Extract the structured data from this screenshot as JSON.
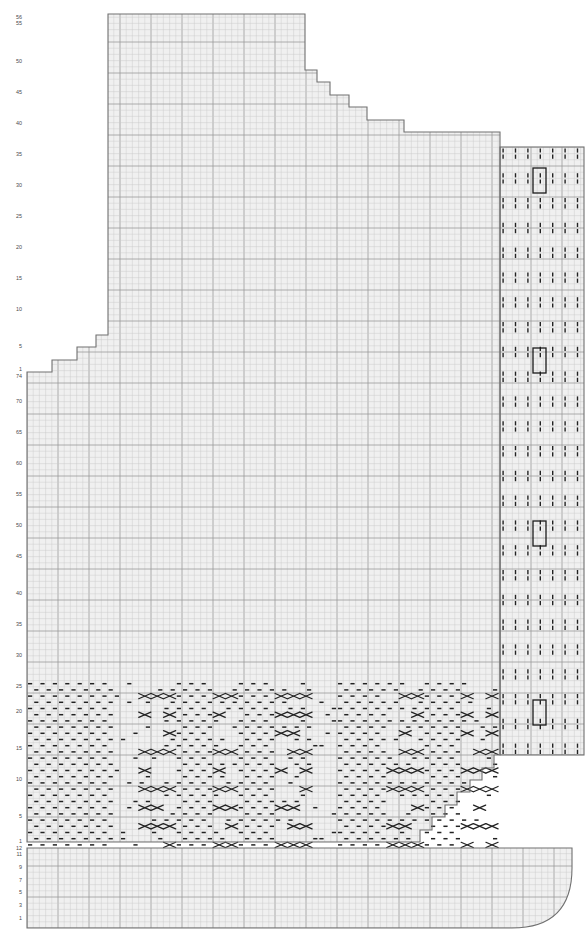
{
  "document": {
    "title": "Knitting Chart — Cabled Sweater Front/Back Panel",
    "background_color": "#ffffff",
    "width": 588,
    "height": 935
  },
  "chart_data": {
    "type": "heatmap",
    "xlabel": "",
    "ylabel": "Row",
    "grid": true,
    "legend_position": "none",
    "cell_size": 6.2,
    "colors": {
      "grid_minor": "#c9c9c9",
      "grid_major": "#9a9a9a",
      "outline": "#707070",
      "symbol": "#222222",
      "cell_fill": "#f0f0f0",
      "repeat_box": "#1a1a1a"
    },
    "panels": [
      {
        "name": "main-body",
        "description": "Large stepped body panel with cable and moss stitch band at lower section",
        "x": 27,
        "y": 14,
        "columns": 76,
        "rows": 148
      },
      {
        "name": "side-rib-panel",
        "description": "Right-hand vertical twisted-rib side panel with repeat boxes",
        "x": 500,
        "y": 147,
        "columns": 14,
        "rows": 98
      },
      {
        "name": "lower-hem-panel",
        "description": "Bottom hem panel with rounded lower-right corner",
        "x": 27,
        "y": 848,
        "columns": 88,
        "rows": 12
      }
    ],
    "y_axis_groups": [
      {
        "name": "upper-scale",
        "description": "Top shoulder/armhole section row numbering",
        "ticks": [
          {
            "label": "56",
            "y": 18
          },
          {
            "label": "55",
            "y": 24
          },
          {
            "label": "50",
            "y": 62
          },
          {
            "label": "45",
            "y": 93
          },
          {
            "label": "40",
            "y": 124
          },
          {
            "label": "35",
            "y": 155
          },
          {
            "label": "30",
            "y": 186
          },
          {
            "label": "25",
            "y": 217
          },
          {
            "label": "20",
            "y": 248
          },
          {
            "label": "15",
            "y": 279
          },
          {
            "label": "10",
            "y": 310
          },
          {
            "label": "5",
            "y": 347
          }
        ]
      },
      {
        "name": "middle-scale",
        "description": "Main body row numbering, counts downward from 74",
        "ticks": [
          {
            "label": "1",
            "y": 370
          },
          {
            "label": "74",
            "y": 377
          },
          {
            "label": "70",
            "y": 402
          },
          {
            "label": "65",
            "y": 433
          },
          {
            "label": "60",
            "y": 464
          },
          {
            "label": "55",
            "y": 495
          },
          {
            "label": "50",
            "y": 526
          },
          {
            "label": "45",
            "y": 557
          },
          {
            "label": "40",
            "y": 594
          },
          {
            "label": "35",
            "y": 625
          },
          {
            "label": "30",
            "y": 656
          },
          {
            "label": "25",
            "y": 687
          },
          {
            "label": "20",
            "y": 712
          },
          {
            "label": "15",
            "y": 749
          },
          {
            "label": "10",
            "y": 780
          },
          {
            "label": "5",
            "y": 817
          },
          {
            "label": "1",
            "y": 842
          }
        ]
      },
      {
        "name": "hem-scale",
        "description": "Lower hem panel row numbering",
        "ticks": [
          {
            "label": "12",
            "y": 849
          },
          {
            "label": "11",
            "y": 855
          },
          {
            "label": "9",
            "y": 868
          },
          {
            "label": "7",
            "y": 881
          },
          {
            "label": "5",
            "y": 893
          },
          {
            "label": "3",
            "y": 906
          },
          {
            "label": "1",
            "y": 919
          }
        ]
      }
    ],
    "symbols": [
      {
        "key": "purl",
        "glyph": "dash",
        "description": "Horizontal dash — purl stitch"
      },
      {
        "key": "cable-cross",
        "glyph": "x-cross",
        "description": "Two-cell X — cable cross stitch"
      },
      {
        "key": "twisted-knit",
        "glyph": "vertical-tick",
        "description": "Vertical tick — twisted knit stitch"
      },
      {
        "key": "blank",
        "glyph": "empty",
        "description": "Empty cell — knit stitch"
      }
    ],
    "repeat_boxes": [
      {
        "panel": "side-rib-panel",
        "x": 533,
        "y": 168,
        "width": 13,
        "height": 25
      },
      {
        "panel": "side-rib-panel",
        "x": 533,
        "y": 348,
        "width": 13,
        "height": 25
      },
      {
        "panel": "side-rib-panel",
        "x": 533,
        "y": 521,
        "width": 13,
        "height": 25
      },
      {
        "panel": "side-rib-panel",
        "x": 533,
        "y": 700,
        "width": 13,
        "height": 25
      }
    ],
    "shaping": {
      "top_right_steps": [
        {
          "x": 305,
          "y": 14
        },
        {
          "x": 305,
          "y": 70
        },
        {
          "x": 317,
          "y": 70
        },
        {
          "x": 317,
          "y": 82
        },
        {
          "x": 330,
          "y": 82
        },
        {
          "x": 330,
          "y": 95
        },
        {
          "x": 349,
          "y": 95
        },
        {
          "x": 349,
          "y": 107
        },
        {
          "x": 367,
          "y": 107
        },
        {
          "x": 367,
          "y": 120
        },
        {
          "x": 404,
          "y": 120
        },
        {
          "x": 404,
          "y": 132
        },
        {
          "x": 500,
          "y": 132
        }
      ],
      "left_steps": [
        {
          "x": 27,
          "y": 372
        },
        {
          "x": 52,
          "y": 372
        },
        {
          "x": 52,
          "y": 360
        },
        {
          "x": 77,
          "y": 360
        },
        {
          "x": 77,
          "y": 347
        },
        {
          "x": 96,
          "y": 347
        },
        {
          "x": 96,
          "y": 335
        },
        {
          "x": 108,
          "y": 335
        },
        {
          "x": 108,
          "y": 14
        }
      ],
      "lower_right_steps": [
        {
          "x": 500,
          "y": 755
        },
        {
          "x": 494,
          "y": 755
        },
        {
          "x": 494,
          "y": 768
        },
        {
          "x": 482,
          "y": 768
        },
        {
          "x": 482,
          "y": 780
        },
        {
          "x": 470,
          "y": 780
        },
        {
          "x": 470,
          "y": 792
        },
        {
          "x": 457,
          "y": 792
        },
        {
          "x": 457,
          "y": 805
        },
        {
          "x": 445,
          "y": 805
        },
        {
          "x": 445,
          "y": 817
        },
        {
          "x": 432,
          "y": 817
        },
        {
          "x": 432,
          "y": 830
        },
        {
          "x": 420,
          "y": 830
        },
        {
          "x": 420,
          "y": 842
        },
        {
          "x": 27,
          "y": 842
        }
      ]
    },
    "stitch_band": {
      "description": "Cable and moss-stitch pattern band spanning rows 1-25 of main body",
      "y_top": 682,
      "y_bottom": 848,
      "x_left": 27,
      "x_right": 500
    }
  }
}
